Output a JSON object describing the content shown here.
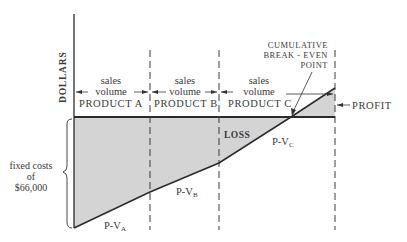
{
  "axis": {
    "ylabel": "DOLLARS"
  },
  "segments": [
    {
      "top": "sales",
      "bottom": "volume",
      "product": "PRODUCT A"
    },
    {
      "top": "sales",
      "bottom": "volume",
      "product": "PRODUCT B"
    },
    {
      "top": "sales",
      "bottom": "volume",
      "product": "PRODUCT C"
    }
  ],
  "annotations": {
    "break_even": [
      "CUMULATIVE",
      "BREAK - EVEN",
      "POINT"
    ],
    "profit": "PROFIT",
    "loss": "LOSS",
    "fixed_costs": [
      "fixed costs",
      "of",
      "$66,000"
    ],
    "pv_labels": [
      {
        "base": "P-V",
        "sub": "A"
      },
      {
        "base": "P-V",
        "sub": "B"
      },
      {
        "base": "P-V",
        "sub": "C"
      }
    ]
  },
  "colors": {
    "fill": "#d4d4d4",
    "line": "#2a2a2a"
  }
}
